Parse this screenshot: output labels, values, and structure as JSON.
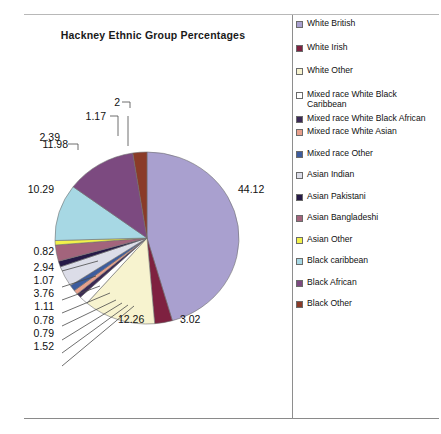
{
  "chart_data": {
    "type": "pie",
    "title": "Hackney Ethnic Group Percentages",
    "xlabel": "",
    "ylabel": "",
    "legend_position": "right",
    "grid": false,
    "categories": [
      "White British",
      "White Irish",
      "White Other",
      "Mixed race White Black Caribbean",
      "Mixed race White Black African",
      "Mixed race White Asian",
      "Mixed race Other",
      "Asian Indian",
      "Asian Pakistani",
      "Asian Bangladeshi",
      "Asian Other",
      "Black caribbean",
      "Black African",
      "Black Other"
    ],
    "values": [
      44.12,
      3.02,
      12.26,
      1.52,
      0.79,
      0.78,
      1.11,
      3.76,
      1.07,
      2.94,
      0.82,
      10.29,
      11.98,
      2.39
    ],
    "colors": [
      "#a9a0cf",
      "#7e2140",
      "#f7f3cf",
      "#ffffff",
      "#3b2a55",
      "#e8a08c",
      "#3d5c9e",
      "#dcdde8",
      "#261a47",
      "#a3647c",
      "#f2f24a",
      "#a7d8e4",
      "#7c4a80",
      "#8a3b28"
    ],
    "extra_labels": [
      {
        "text": "2",
        "note": "leader label near top of pie"
      },
      {
        "text": "1.17",
        "note": "leader label near top of pie"
      }
    ]
  },
  "chart": {
    "title": "Hackney Ethnic Group Percentages",
    "labels": {
      "p_44_12": "44.12",
      "p_3_02": "3.02",
      "p_12_26": "12.26",
      "p_1_52": "1.52",
      "p_0_79": "0.79",
      "p_0_78": "0.78",
      "p_1_11": "1.11",
      "p_3_76": "3.76",
      "p_1_07": "1.07",
      "p_2_94": "2.94",
      "p_0_82": "0.82",
      "p_10_29": "10.29",
      "p_11_98": "11.98",
      "p_2_39": "2.39",
      "p_1_17": "1.17",
      "p_2": "2"
    }
  },
  "legend": {
    "items": [
      {
        "label": "White British",
        "color": "#a9a0cf"
      },
      {
        "label": "White Irish",
        "color": "#7e2140"
      },
      {
        "label": "White Other",
        "color": "#f7f3cf"
      },
      {
        "label": "Mixed race White Black Caribbean",
        "color": "#ffffff"
      },
      {
        "label": "Mixed race White Black African",
        "color": "#3b2a55"
      },
      {
        "label": "Mixed race White Asian",
        "color": "#e8a08c"
      },
      {
        "label": "Mixed race Other",
        "color": "#3d5c9e"
      },
      {
        "label": "Asian Indian",
        "color": "#dcdde8"
      },
      {
        "label": "Asian Pakistani",
        "color": "#261a47"
      },
      {
        "label": "Asian Bangladeshi",
        "color": "#a3647c"
      },
      {
        "label": "Asian Other",
        "color": "#f2f24a"
      },
      {
        "label": "Black caribbean",
        "color": "#a7d8e4"
      },
      {
        "label": "Black African",
        "color": "#7c4a80"
      },
      {
        "label": "Black Other",
        "color": "#8a3b28"
      }
    ]
  }
}
